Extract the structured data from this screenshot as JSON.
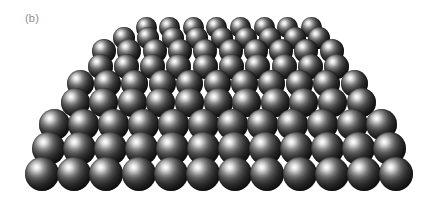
{
  "figure": {
    "panel_label": "(b)",
    "caption_label_color": "#8c8c8c",
    "background_color": "#ffffff",
    "sphere_dark_color": "#0a0a0a",
    "sphere_highlight_color": "#ffffff",
    "illustration_kind": "close-packed-sphere-lattice",
    "view": "perspective-from-above-front",
    "light_direction": "upper-left"
  },
  "chart_data": {
    "type": "scatter",
    "title": "(b)",
    "xlabel": "",
    "ylabel": "",
    "rows_front_to_back": 9,
    "front_row_count": 12,
    "back_row_count": 8,
    "front_row_sphere_diameter_px": 34,
    "back_row_sphere_diameter_px": 21,
    "grid": false,
    "legend": "none",
    "spheres": [
      {
        "row": 0,
        "count": 12,
        "cx_start": 42,
        "spacing": 32.2,
        "cy": 174,
        "d": 34
      },
      {
        "row": 1,
        "count": 12,
        "cx_start": 48,
        "spacing": 31.0,
        "cy": 148,
        "d": 33
      },
      {
        "row": 2,
        "count": 12,
        "cx_start": 54,
        "spacing": 29.8,
        "cy": 124,
        "d": 31
      },
      {
        "row": 3,
        "count": 11,
        "cx_start": 75,
        "spacing": 28.6,
        "cy": 102,
        "d": 29
      },
      {
        "row": 4,
        "count": 11,
        "cx_start": 80,
        "spacing": 27.4,
        "cy": 83,
        "d": 27
      },
      {
        "row": 5,
        "count": 10,
        "cx_start": 100,
        "spacing": 26.3,
        "cy": 66,
        "d": 25
      },
      {
        "row": 6,
        "count": 10,
        "cx_start": 104,
        "spacing": 25.3,
        "cy": 51,
        "d": 24
      },
      {
        "row": 7,
        "count": 9,
        "cx_start": 124,
        "spacing": 24.4,
        "cy": 38,
        "d": 22
      },
      {
        "row": 8,
        "count": 8,
        "cx_start": 146,
        "spacing": 23.6,
        "cy": 27,
        "d": 21
      }
    ]
  }
}
